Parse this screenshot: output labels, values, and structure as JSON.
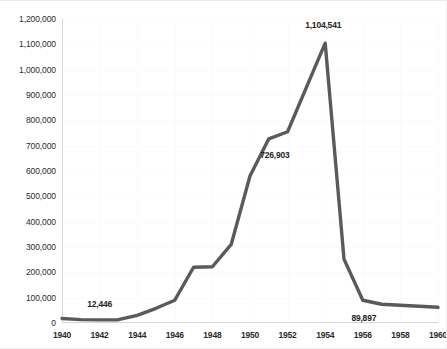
{
  "chart_data": {
    "type": "line",
    "title": "",
    "subtitle": "",
    "xlabel": "",
    "ylabel": "",
    "xlim": [
      1940,
      1960
    ],
    "ylim": [
      0,
      1200000
    ],
    "grid": true,
    "legend": "none",
    "x": [
      1940,
      1941,
      1942,
      1943,
      1944,
      1945,
      1946,
      1947,
      1948,
      1949,
      1950,
      1951,
      1952,
      1953,
      1954,
      1955,
      1956,
      1957,
      1958,
      1959,
      1960
    ],
    "series": [
      {
        "name": "Cases",
        "color": "#5a5a5a",
        "values": [
          18000,
          13500,
          12446,
          13000,
          30000,
          58000,
          90000,
          220000,
          222000,
          310000,
          580000,
          726903,
          755000,
          930000,
          1104541,
          252000,
          89897,
          74000,
          70000,
          66000,
          62000
        ]
      }
    ],
    "y_ticks": [
      "0",
      "100,000",
      "200,000",
      "300,000",
      "400,000",
      "500,000",
      "600,000",
      "700,000",
      "800,000",
      "900,000",
      "1,000,000",
      "1,100,000",
      "1,200,000"
    ],
    "y_tick_values": [
      0,
      100000,
      200000,
      300000,
      400000,
      500000,
      600000,
      700000,
      800000,
      900000,
      1000000,
      1100000,
      1200000
    ],
    "x_ticks": [
      "1940",
      "1942",
      "1944",
      "1946",
      "1948",
      "1950",
      "1952",
      "1954",
      "1956",
      "1958",
      "1960"
    ],
    "x_tick_values": [
      1940,
      1942,
      1944,
      1946,
      1948,
      1950,
      1952,
      1954,
      1956,
      1958,
      1960
    ],
    "annotations": [
      {
        "text": "12,446",
        "x": 1942,
        "y": 12446,
        "dx": 0,
        "dy": -16
      },
      {
        "text": "726,903",
        "x": 1951,
        "y": 726903,
        "dx": 6,
        "dy": 16
      },
      {
        "text": "1,104,541",
        "x": 1954,
        "y": 1104541,
        "dx": -2,
        "dy": -18
      },
      {
        "text": "89,897",
        "x": 1956,
        "y": 89897,
        "dx": 1,
        "dy": 18
      }
    ]
  },
  "style": {
    "line_color": "#5a5a5a",
    "grid_color": "#fbfbfb",
    "axis_color": "#d6d6d6",
    "text_color": "#2b2b2b",
    "background": "#ffffff"
  }
}
